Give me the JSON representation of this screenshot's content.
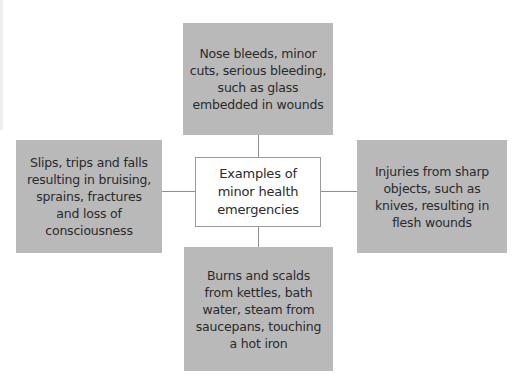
{
  "heading_partial": "...pical ... g...",
  "diagram": {
    "center": {
      "label": "Examples of minor health emergencies"
    },
    "nodes": [
      {
        "position": "top",
        "label": "Nose bleeds, minor cuts, serious bleeding, such as glass embedded in wounds"
      },
      {
        "position": "left",
        "label": "Slips, trips and falls resulting in bruising, sprains, fractures and loss of consciousness"
      },
      {
        "position": "right",
        "label": "Injuries from sharp objects, such as knives, resulting in flesh wounds"
      },
      {
        "position": "bottom",
        "label": "Burns and scalds from kettles, bath water, steam from saucepans, touching a hot iron"
      }
    ]
  },
  "colors": {
    "node_fill": "#b9b9b9",
    "center_fill": "#ffffff",
    "connector": "#8f8f8f"
  }
}
